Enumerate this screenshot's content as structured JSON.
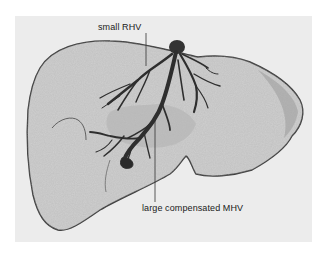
{
  "figure": {
    "labels": [
      {
        "id": "rhv",
        "text": "small RHV"
      },
      {
        "id": "mhv",
        "text": "large compensated MHV"
      }
    ],
    "colors": {
      "background": "#ffffff",
      "panel": "#ececec",
      "liver_fill": "#c9c9c9",
      "liver_edge": "#4a4a4a",
      "vein": "#2e2e2e",
      "leader_line": "#333333"
    }
  }
}
